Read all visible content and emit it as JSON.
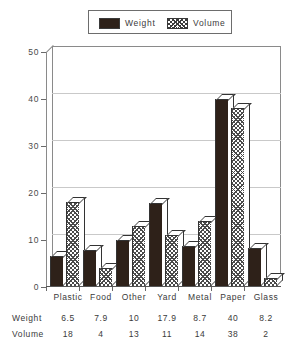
{
  "legend": {
    "entries": [
      {
        "label": "Weight",
        "swatch": "solid-dark-swatch",
        "color": "#2e2119"
      },
      {
        "label": "Volume",
        "swatch": "crosshatch-swatch",
        "color": "#4a4a4a"
      }
    ]
  },
  "table": {
    "row_headers": [
      "Weight",
      "Volume"
    ]
  },
  "chart_data": {
    "type": "bar",
    "title": "",
    "subtitle": "",
    "xlabel": "",
    "ylabel": "",
    "ylim": [
      0,
      50
    ],
    "yticks": [
      0,
      10,
      20,
      30,
      40,
      50
    ],
    "grid": true,
    "legend_position": "top-center",
    "style": "3d-bars",
    "categories": [
      "Plastic",
      "Food",
      "Other",
      "Yard",
      "Metal",
      "Paper",
      "Glass"
    ],
    "series": [
      {
        "name": "Weight",
        "values": [
          6.5,
          7.9,
          10,
          17.9,
          8.7,
          40,
          8.2
        ]
      },
      {
        "name": "Volume",
        "values": [
          18,
          4,
          13,
          11,
          14,
          38,
          2
        ]
      }
    ]
  }
}
